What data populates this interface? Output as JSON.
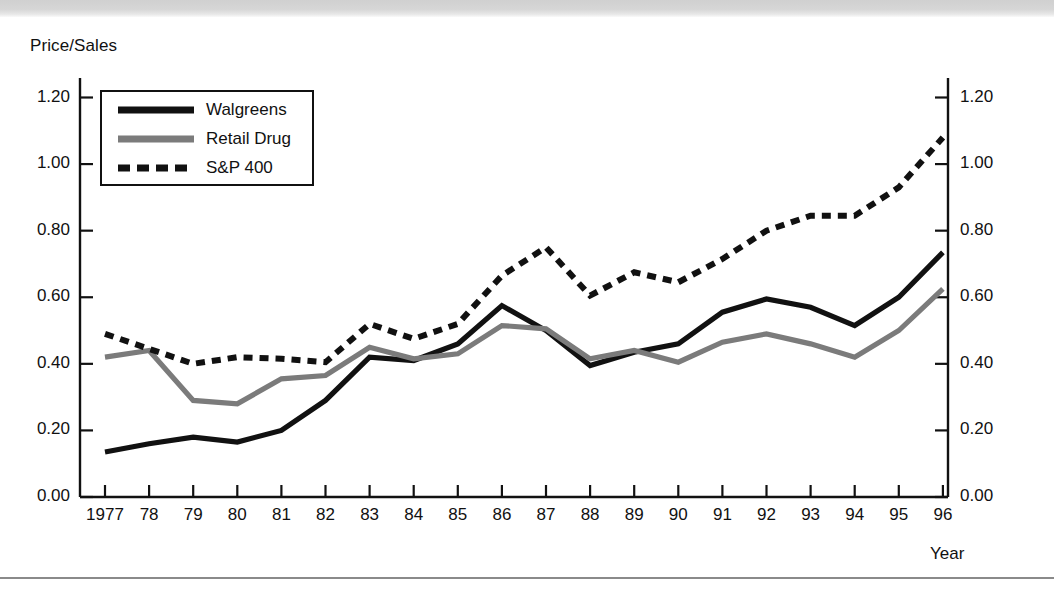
{
  "figure": {
    "y_axis_title": "Price/Sales",
    "x_axis_title": "Year"
  },
  "legend": {
    "position": "top-left-inside",
    "entries": [
      {
        "label": "Walgreens",
        "style": "solid",
        "color": "#111111"
      },
      {
        "label": "Retail Drug",
        "style": "solid",
        "color": "#7b7b7b"
      },
      {
        "label": "S&P 400",
        "style": "dashed",
        "color": "#111111"
      }
    ]
  },
  "axes": {
    "y_ticks": [
      "0.00",
      "0.20",
      "0.40",
      "0.60",
      "0.80",
      "1.00",
      "1.20"
    ],
    "y_ticks_right": [
      "0.00",
      "0.20",
      "0.40",
      "0.60",
      "0.80",
      "1.00",
      "1.20"
    ],
    "x_ticks": [
      "1977",
      "78",
      "79",
      "80",
      "81",
      "82",
      "83",
      "84",
      "85",
      "86",
      "87",
      "88",
      "89",
      "90",
      "91",
      "92",
      "93",
      "94",
      "95",
      "96"
    ]
  },
  "chart_data": {
    "type": "line",
    "title": "",
    "xlabel": "Year",
    "ylabel": "Price/Sales",
    "ylim": [
      0.0,
      1.2
    ],
    "grid": false,
    "legend_position": "upper left",
    "categories": [
      "1977",
      "1978",
      "1979",
      "1980",
      "1981",
      "1982",
      "1983",
      "1984",
      "1985",
      "1986",
      "1987",
      "1988",
      "1989",
      "1990",
      "1991",
      "1992",
      "1993",
      "1994",
      "1995",
      "1996"
    ],
    "series": [
      {
        "name": "Walgreens",
        "style": "solid",
        "color": "#111111",
        "values": [
          0.135,
          0.16,
          0.18,
          0.165,
          0.2,
          0.29,
          0.42,
          0.41,
          0.46,
          0.575,
          0.5,
          0.395,
          0.435,
          0.46,
          0.555,
          0.595,
          0.57,
          0.515,
          0.6,
          0.735
        ]
      },
      {
        "name": "Retail Drug",
        "style": "solid",
        "color": "#7b7b7b",
        "values": [
          0.42,
          0.44,
          0.29,
          0.28,
          0.355,
          0.365,
          0.45,
          0.415,
          0.43,
          0.515,
          0.505,
          0.415,
          0.44,
          0.405,
          0.465,
          0.49,
          0.46,
          0.42,
          0.5,
          0.625
        ]
      },
      {
        "name": "S&P 400",
        "style": "dashed",
        "color": "#111111",
        "values": [
          0.49,
          0.445,
          0.4,
          0.42,
          0.415,
          0.405,
          0.52,
          0.475,
          0.52,
          0.665,
          0.75,
          0.605,
          0.675,
          0.645,
          0.715,
          0.8,
          0.845,
          0.845,
          0.93,
          1.08
        ]
      }
    ]
  }
}
